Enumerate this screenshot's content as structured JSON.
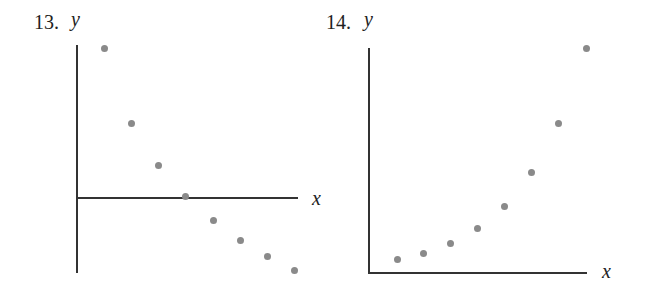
{
  "chart_data": [
    {
      "type": "scatter",
      "title": "13.",
      "xlabel": "x",
      "ylabel": "y",
      "grid": false,
      "axes": {
        "x_axis_crosses_y_at": 0
      },
      "x": [
        1,
        2,
        3,
        4,
        5,
        6,
        7,
        8
      ],
      "y": [
        6.0,
        3.0,
        1.25,
        0.1,
        -0.9,
        -1.7,
        -2.4,
        -2.9
      ],
      "px": [
        [
          104,
          48
        ],
        [
          131,
          123
        ],
        [
          158,
          165
        ],
        [
          185,
          196
        ],
        [
          213,
          220
        ],
        [
          240,
          240
        ],
        [
          267,
          256
        ],
        [
          294,
          270
        ]
      ]
    },
    {
      "type": "scatter",
      "title": "14.",
      "xlabel": "x",
      "ylabel": "y",
      "grid": false,
      "axes": {
        "x_axis_crosses_y_at": 0
      },
      "x": [
        1,
        2,
        3,
        4,
        5,
        6,
        7,
        8
      ],
      "y": [
        0.6,
        0.9,
        1.3,
        1.9,
        2.8,
        4.2,
        6.2,
        9.2
      ],
      "px": [
        [
          397,
          259
        ],
        [
          423,
          253
        ],
        [
          450,
          243
        ],
        [
          477,
          228
        ],
        [
          504,
          206
        ],
        [
          531,
          172
        ],
        [
          558,
          123
        ],
        [
          586,
          48
        ]
      ]
    }
  ],
  "plots": [
    {
      "number": "13.",
      "ylabel": "y",
      "xlabel": "x"
    },
    {
      "number": "14.",
      "ylabel": "y",
      "xlabel": "x"
    }
  ]
}
